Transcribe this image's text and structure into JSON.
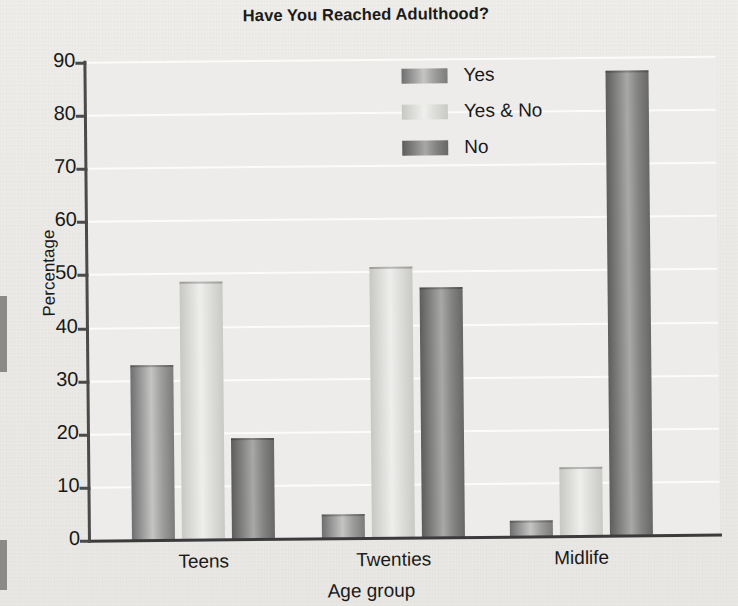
{
  "chart_data": {
    "type": "bar",
    "title": "Have You Reached Adulthood?",
    "xlabel": "Age group",
    "ylabel": "Percentage",
    "categories": [
      "Teens",
      "Twenties",
      "Midlife"
    ],
    "series": [
      {
        "name": "Yes",
        "values": [
          33,
          4.5,
          3
        ]
      },
      {
        "name": "Yes & No",
        "values": [
          48.5,
          51,
          13
        ]
      },
      {
        "name": "No",
        "values": [
          19,
          47,
          87.5
        ]
      }
    ],
    "ylim": [
      0,
      90
    ],
    "yticks": [
      0,
      10,
      20,
      30,
      40,
      50,
      60,
      70,
      80,
      90
    ],
    "grid": true,
    "legend_position": "top-center",
    "colors": {
      "yes": "#8f8f8f",
      "yes_and_no": "#dededb",
      "no": "#787877",
      "plot_background": "#eeecea",
      "gridline": "#fbfbfa",
      "axis": "#3b3b3b",
      "text": "#171717"
    }
  }
}
